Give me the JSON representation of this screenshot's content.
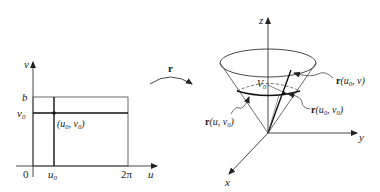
{
  "left_plot": {
    "axis_v_label": "v",
    "axis_u_label": "u",
    "origin_label": "0",
    "tick_b": "b",
    "tick_v0": "v",
    "tick_v0_sub": "0",
    "tick_u0": "u",
    "tick_u0_sub": "0",
    "tick_2pi": "2π",
    "point_label": "(u",
    "point_label_sub1": "0",
    "point_label_mid": ", v",
    "point_label_sub2": "0",
    "point_label_end": ")"
  },
  "mapping_arrow": {
    "label": "r"
  },
  "right_plot": {
    "axis_z_label": "z",
    "axis_y_label": "y",
    "axis_x_label": "x",
    "inner_label": "V",
    "inner_label_sub": "0",
    "callout_u0_v": {
      "bold": "r",
      "text": "(u",
      "sub": "0",
      "end": ", v)"
    },
    "callout_u0_v0": {
      "bold": "r",
      "text": "(u",
      "sub": "0",
      "mid": ", v",
      "sub2": "0",
      "end": ")"
    },
    "callout_u_v0": {
      "bold": "r",
      "text": "(u, v",
      "sub": "0",
      "end": ")"
    }
  },
  "colors": {
    "line": "#222222",
    "thin": "#555555"
  }
}
